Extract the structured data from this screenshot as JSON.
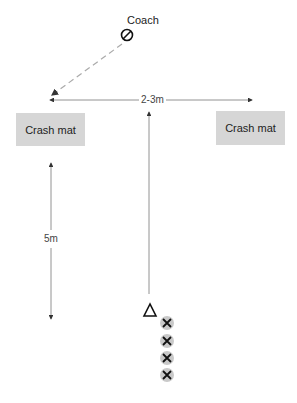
{
  "diagram": {
    "coach": {
      "label": "Coach",
      "icon": "circle-slash-icon"
    },
    "mats": [
      {
        "label": "Crash mat",
        "position": "left"
      },
      {
        "label": "Crash mat",
        "position": "right"
      }
    ],
    "measurements": {
      "mat_spacing": "2-3m",
      "run_distance": "5m"
    },
    "markers": {
      "start": "triangle-icon",
      "players": [
        "x-icon",
        "x-icon",
        "x-icon",
        "x-icon"
      ]
    },
    "colors": {
      "mat": "#d6d6d6",
      "line": "#555555",
      "dashed": "#aaaaaa",
      "player_bg": "#c9c9c9"
    }
  }
}
